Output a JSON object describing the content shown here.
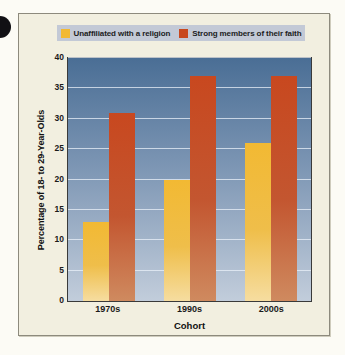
{
  "figure": {
    "background_color": "#f2efe0",
    "border_color": "#8d8a7d"
  },
  "binding_hole": {
    "name": "page-binding-hole",
    "color": "#111014"
  },
  "legend": {
    "position": "top",
    "background_color": "#c3c9d6",
    "entries": [
      {
        "label": "Unaffiliated with a religion",
        "color": "#f2b933"
      },
      {
        "label": "Strong members of their faith",
        "color": "#c8481f"
      }
    ]
  },
  "chart_data": {
    "type": "bar",
    "title": "",
    "subtitle": "",
    "xlabel": "Cohort",
    "ylabel": "Percentage of 18- to 29-Year-Olds",
    "categories": [
      "1970s",
      "1990s",
      "2000s"
    ],
    "series": [
      {
        "name": "Unaffiliated with a religion",
        "color": "#f2b933",
        "values": [
          13,
          20,
          26
        ]
      },
      {
        "name": "Strong members of their faith",
        "color": "#c8481f",
        "values": [
          31,
          37,
          37
        ]
      }
    ],
    "ylim": [
      0,
      40
    ],
    "ytick_step": 5,
    "yticks": [
      0,
      5,
      10,
      15,
      20,
      25,
      30,
      35,
      40
    ],
    "ytick_labels": [
      "0",
      "5",
      "10",
      "15",
      "20",
      "25",
      "30",
      "35",
      "40"
    ],
    "grid": true,
    "grid_axis": "y",
    "grid_color": "#e9f0f8",
    "legend_position": "top",
    "plot_background_top": "#4a6e95",
    "plot_background_bottom": "#c2cddb"
  }
}
